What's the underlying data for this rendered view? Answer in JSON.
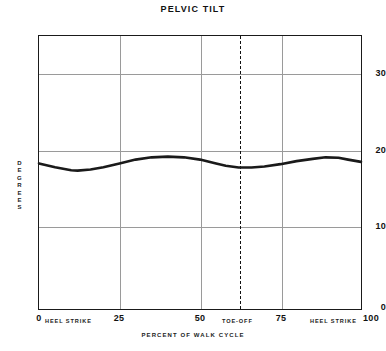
{
  "chart_data": {
    "type": "line",
    "title": "PELVIC TILT",
    "xlabel": "PERCENT OF WALK CYCLE",
    "ylabel": "DEGREES",
    "xlim": [
      0,
      100
    ],
    "ylim": [
      0,
      36
    ],
    "grid": true,
    "legend": "none",
    "y_ticks": [
      0,
      10,
      20,
      30
    ],
    "y_tick_labels": [
      "0",
      "10",
      "20",
      "30"
    ],
    "x_ticks": [
      0,
      25,
      50,
      75,
      100
    ],
    "x_tick_labels": [
      "0",
      "25",
      "50",
      "75",
      "100"
    ],
    "annotations": [
      {
        "name": "heel-strike-start",
        "text": "HEEL STRIKE",
        "x": 0
      },
      {
        "name": "toe-off",
        "text": "TOE-OFF",
        "x": 62,
        "line": "dashed"
      },
      {
        "name": "heel-strike-end",
        "text": "HEEL STRIKE",
        "x": 100
      }
    ],
    "series": [
      {
        "name": "pelvic tilt",
        "x": [
          0,
          5,
          10,
          12,
          16,
          20,
          25,
          30,
          35,
          40,
          45,
          50,
          55,
          58,
          62,
          66,
          70,
          75,
          80,
          85,
          89,
          93,
          96,
          100
        ],
        "values": [
          19.2,
          18.7,
          18.3,
          18.25,
          18.4,
          18.7,
          19.2,
          19.7,
          20.0,
          20.1,
          20.0,
          19.7,
          19.2,
          18.9,
          18.65,
          18.65,
          18.8,
          19.1,
          19.5,
          19.8,
          20.0,
          19.95,
          19.7,
          19.4
        ]
      }
    ]
  },
  "labels": {
    "title": "PELVIC TILT",
    "y_axis_title": "DEGREES",
    "x_axis_title": "PERCENT OF WALK CYCLE",
    "heel_strike_left": "HEEL STRIKE",
    "heel_strike_right": "HEEL STRIKE",
    "toe_off": "TOE-OFF",
    "y0": "0",
    "y10": "10",
    "y20": "20",
    "y30": "30",
    "x0": "0",
    "x25": "25",
    "x50": "50",
    "x75": "75",
    "x100": "100"
  },
  "colors": {
    "curve": "#1a1a1a",
    "frame": "#1a1a1a",
    "grid": "#9a9a9a",
    "background": "#ffffff"
  }
}
